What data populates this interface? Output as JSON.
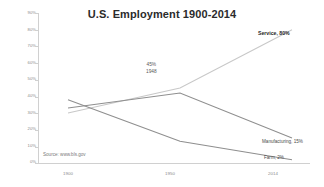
{
  "chart_data": {
    "type": "line",
    "title": "U.S. Employment 1900-2014",
    "xlabel": "",
    "ylabel": "",
    "x": [
      "1900",
      "1950",
      "2014"
    ],
    "categories": [
      "1900",
      "1950",
      "2014"
    ],
    "ylim": [
      0,
      90
    ],
    "y_ticks": [
      "0%",
      "10%",
      "20%",
      "30%",
      "40%",
      "50%",
      "60%",
      "70%",
      "80%",
      "90%"
    ],
    "grid": false,
    "legend_position": "inline-end-labels",
    "series": [
      {
        "name": "Service",
        "values": [
          30,
          45,
          80
        ],
        "color": "#c8c8c8",
        "end_label": "Service, 80%"
      },
      {
        "name": "Manufacturing",
        "values": [
          33,
          42,
          15
        ],
        "color": "#8f8f8f",
        "end_label": "Manufacturing, 15%"
      },
      {
        "name": "Farm",
        "values": [
          38,
          13,
          2
        ],
        "color": "#8f8f8f",
        "end_label": "Farm, 2%"
      }
    ],
    "annotations": [
      {
        "line1": "45%",
        "line2": "1948"
      }
    ],
    "source_note": "Source: www.bls.gov"
  },
  "axis": {
    "y_labels": [
      "90%",
      "80%",
      "70%",
      "60%",
      "50%",
      "40%",
      "30%",
      "20%",
      "10%",
      "0%"
    ],
    "x_labels": [
      "1900",
      "1950",
      "2014"
    ]
  },
  "labels": {
    "service": "Service, 80%",
    "manufacturing": "Manufacturing, 15%",
    "farm": "Farm, 2%"
  },
  "annotation": {
    "value": "45%",
    "year": "1948"
  },
  "source": {
    "text": "Source: www.bls.gov"
  },
  "colors": {
    "service_line": "#c8c8c8",
    "manufacturing_line": "#8f8f8f",
    "farm_line": "#8f8f8f",
    "axis": "#d0d0d0",
    "title": "#2b2b2b",
    "tick_text": "#8a8a8a"
  }
}
